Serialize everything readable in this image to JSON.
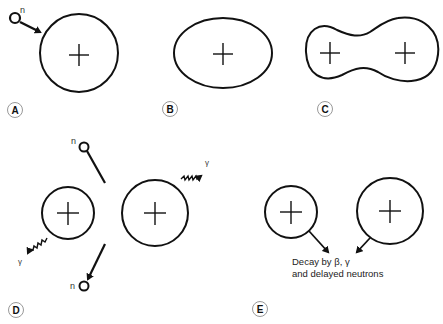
{
  "panels": {
    "A": {
      "label": "A",
      "neutron_label": "n"
    },
    "B": {
      "label": "B"
    },
    "C": {
      "label": "C"
    },
    "D": {
      "label": "D",
      "neutron_top_label": "n",
      "neutron_bottom_label": "n",
      "gamma_top_label": "γ",
      "gamma_bottom_label": "γ"
    },
    "E": {
      "label": "E",
      "caption_line1": "Decay by β, γ",
      "caption_line2": "and delayed neutrons"
    }
  },
  "colors": {
    "stroke": "#111111",
    "label_circle": "#888888",
    "background": "#ffffff"
  }
}
